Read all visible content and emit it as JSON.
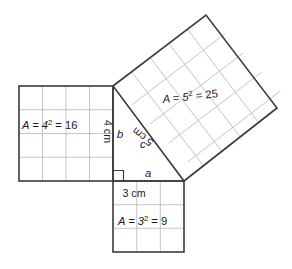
{
  "figure": {
    "background_color": "#ffffff",
    "outline_color": "#3b3b3b",
    "grid_color": "#b6b6b6",
    "text_color": "#1a1a1a"
  },
  "triangle": {
    "right_angle_vertex_label": "right-angle-mark",
    "legs": {
      "horizontal_label": "a",
      "vertical_label": "b",
      "hypotenuse_label": "c"
    }
  },
  "squares": {
    "left": {
      "name": "square-on-leg-b",
      "side_length": 4,
      "side_label": "4 cm",
      "area_label_prefix": "A = 4",
      "area_label_exponent": "2",
      "area_label_suffix": " = 16",
      "area_value": 16,
      "grid_rows": 4,
      "grid_cols": 4
    },
    "bottom": {
      "name": "square-on-leg-a",
      "side_length": 3,
      "side_label": "3 cm",
      "area_label_prefix": "A = 3",
      "area_label_exponent": "2",
      "area_label_suffix": " = 9",
      "area_value": 9,
      "grid_rows": 3,
      "grid_cols": 3
    },
    "hypotenuse": {
      "name": "square-on-hypotenuse-c",
      "side_length": 5,
      "side_label": "5 cm",
      "area_label_prefix": "A = 5",
      "area_label_exponent": "2",
      "area_label_suffix": " = 25",
      "area_value": 25,
      "grid_rows": 5,
      "grid_cols": 5
    }
  },
  "side_labels": {
    "a": "a",
    "b": "b",
    "c": "c"
  }
}
